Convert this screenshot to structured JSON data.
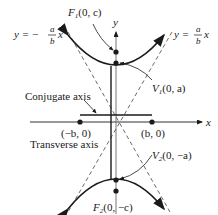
{
  "diagram": {
    "type": "vertical hyperbola with asymptotes, foci, vertices and axes",
    "axes": {
      "x_label": "x",
      "y_label": "y"
    },
    "asymptotes": {
      "left": {
        "prefix": "y = −",
        "num": "a",
        "den": "b",
        "suffix": "x"
      },
      "right": {
        "prefix": "y = ",
        "num": "a",
        "den": "b",
        "suffix": "x"
      }
    },
    "points": {
      "F1": {
        "name": "F",
        "sub": "1",
        "coords": "(0, c)"
      },
      "V1": {
        "name": "V",
        "sub": "1",
        "coords": "(0, a)"
      },
      "V2": {
        "name": "V",
        "sub": "2",
        "coords": "(0, −a)"
      },
      "F2": {
        "name": "F",
        "sub": "2",
        "coords": "(0, −c)"
      },
      "neg_b": {
        "label": "(−b, 0)"
      },
      "pos_b": {
        "label": "(b, 0)"
      }
    },
    "labels": {
      "conjugate_axis": "Conjugate axis",
      "transverse_axis": "Transverse axis"
    },
    "colors": {
      "ink": "#1a1a1a",
      "axis": "#555555",
      "dashed": "#444444"
    }
  }
}
